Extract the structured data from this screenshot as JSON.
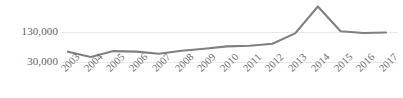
{
  "chart_data": {
    "type": "line",
    "title": "",
    "xlabel": "",
    "ylabel": "",
    "categories": [
      "2003",
      "2004",
      "2005",
      "2006",
      "2007",
      "2008",
      "2009",
      "2010",
      "2011",
      "2012",
      "2013",
      "2014",
      "2015",
      "2016",
      "2017"
    ],
    "values": [
      65000,
      47000,
      67000,
      65000,
      58000,
      68000,
      75000,
      83000,
      85000,
      92000,
      127000,
      218000,
      134000,
      128000,
      130000
    ],
    "series": [
      {
        "name": "series-1",
        "values": [
          65000,
          47000,
          67000,
          65000,
          58000,
          68000,
          75000,
          83000,
          85000,
          92000,
          127000,
          218000,
          134000,
          128000,
          130000
        ]
      }
    ],
    "y_ticks": [
      30000,
      130000
    ],
    "y_tick_labels": [
      "30,000",
      "130,000"
    ],
    "ylim": [
      30000,
      240000
    ],
    "grid": true,
    "legend": false,
    "legend_position": "none",
    "line_color": "#808080",
    "gridline_color": "#e9e9e9",
    "tick_label_color": "#5f5f5f",
    "background_color": "#ffffff",
    "x_tick_rotation": -45,
    "markers": false
  }
}
